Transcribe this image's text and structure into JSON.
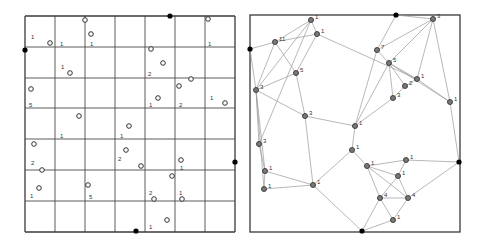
{
  "figure": {
    "panels": [
      {
        "id": "grid-panel",
        "frame": {
          "x": 25,
          "y": 16,
          "w": 210,
          "h": 216
        },
        "grid_x": [
          25,
          55,
          85,
          115,
          145,
          175,
          205,
          235
        ],
        "grid_y": [
          16,
          47,
          78,
          108,
          139,
          170,
          201,
          232
        ],
        "black_nodes": [
          {
            "x": 25,
            "y": 50
          },
          {
            "x": 170,
            "y": 16
          },
          {
            "x": 235,
            "y": 162
          },
          {
            "x": 136,
            "y": 231
          }
        ],
        "open_points": [
          {
            "x": 85,
            "y": 20
          },
          {
            "x": 91,
            "y": 34
          },
          {
            "x": 50,
            "y": 43
          },
          {
            "x": 208,
            "y": 19
          },
          {
            "x": 151,
            "y": 49
          },
          {
            "x": 163,
            "y": 63
          },
          {
            "x": 70,
            "y": 73
          },
          {
            "x": 31,
            "y": 89
          },
          {
            "x": 191,
            "y": 79
          },
          {
            "x": 179,
            "y": 86
          },
          {
            "x": 158,
            "y": 98
          },
          {
            "x": 225,
            "y": 103
          },
          {
            "x": 79,
            "y": 116
          },
          {
            "x": 129,
            "y": 126
          },
          {
            "x": 34,
            "y": 144
          },
          {
            "x": 126,
            "y": 150
          },
          {
            "x": 141,
            "y": 166
          },
          {
            "x": 181,
            "y": 160
          },
          {
            "x": 42,
            "y": 170
          },
          {
            "x": 172,
            "y": 176
          },
          {
            "x": 39,
            "y": 188
          },
          {
            "x": 88,
            "y": 185
          },
          {
            "x": 154,
            "y": 199
          },
          {
            "x": 182,
            "y": 199
          },
          {
            "x": 167,
            "y": 220
          }
        ],
        "labels": [
          {
            "x": 31,
            "y": 39,
            "t": "1"
          },
          {
            "x": 60,
            "y": 46,
            "t": "1"
          },
          {
            "x": 90,
            "y": 46,
            "t": "1"
          },
          {
            "x": 208,
            "y": 46,
            "t": "1"
          },
          {
            "x": 61,
            "y": 69,
            "t": "1"
          },
          {
            "x": 148,
            "y": 76,
            "t": "2"
          },
          {
            "x": 29,
            "y": 107,
            "t": "5"
          },
          {
            "x": 149,
            "y": 107,
            "t": "1"
          },
          {
            "x": 179,
            "y": 107,
            "t": "2"
          },
          {
            "x": 210,
            "y": 100,
            "t": "1"
          },
          {
            "x": 60,
            "y": 138,
            "t": "1"
          },
          {
            "x": 120,
            "y": 138,
            "t": "1"
          },
          {
            "x": 31,
            "y": 165,
            "t": "2"
          },
          {
            "x": 118,
            "y": 161,
            "t": "2"
          },
          {
            "x": 180,
            "y": 170,
            "t": "1"
          },
          {
            "x": 30,
            "y": 198,
            "t": "1"
          },
          {
            "x": 89,
            "y": 199,
            "t": "5"
          },
          {
            "x": 149,
            "y": 195,
            "t": "2"
          },
          {
            "x": 179,
            "y": 195,
            "t": "1"
          },
          {
            "x": 149,
            "y": 229,
            "t": "1"
          }
        ]
      },
      {
        "id": "network-panel",
        "frame": {
          "x": 250,
          "y": 15,
          "w": 210,
          "h": 217
        },
        "black_nodes": [
          {
            "id": "L",
            "x": 250,
            "y": 49
          },
          {
            "id": "T",
            "x": 396,
            "y": 15
          },
          {
            "id": "R",
            "x": 459,
            "y": 162
          },
          {
            "id": "B",
            "x": 362,
            "y": 231
          }
        ],
        "nodes": [
          {
            "id": "a",
            "x": 311,
            "y": 20,
            "t": "1"
          },
          {
            "id": "b",
            "x": 317,
            "y": 34,
            "t": "1"
          },
          {
            "id": "c",
            "x": 275,
            "y": 42,
            "t": "11"
          },
          {
            "id": "d",
            "x": 296,
            "y": 73,
            "t": "5"
          },
          {
            "id": "e",
            "x": 256,
            "y": 90,
            "t": "3"
          },
          {
            "id": "f",
            "x": 305,
            "y": 116,
            "t": "3"
          },
          {
            "id": "g",
            "x": 259,
            "y": 144,
            "t": "3"
          },
          {
            "id": "h",
            "x": 265,
            "y": 171,
            "t": "1"
          },
          {
            "id": "i",
            "x": 264,
            "y": 189,
            "t": "1"
          },
          {
            "id": "j",
            "x": 313,
            "y": 185,
            "t": "1"
          },
          {
            "id": "k",
            "x": 433,
            "y": 19,
            "t": "3"
          },
          {
            "id": "l",
            "x": 377,
            "y": 50,
            "t": "7"
          },
          {
            "id": "m",
            "x": 389,
            "y": 63,
            "t": "5"
          },
          {
            "id": "n",
            "x": 417,
            "y": 79,
            "t": "1"
          },
          {
            "id": "o",
            "x": 405,
            "y": 86,
            "t": "2"
          },
          {
            "id": "p",
            "x": 393,
            "y": 98,
            "t": "3"
          },
          {
            "id": "q",
            "x": 450,
            "y": 102,
            "t": "1"
          },
          {
            "id": "r",
            "x": 355,
            "y": 126,
            "t": "1"
          },
          {
            "id": "s",
            "x": 352,
            "y": 150,
            "t": "1"
          },
          {
            "id": "t",
            "x": 367,
            "y": 166,
            "t": "1"
          },
          {
            "id": "u",
            "x": 406,
            "y": 160,
            "t": "1"
          },
          {
            "id": "v",
            "x": 398,
            "y": 176,
            "t": "1"
          },
          {
            "id": "w",
            "x": 380,
            "y": 198,
            "t": "4"
          },
          {
            "id": "x",
            "x": 408,
            "y": 198,
            "t": "4"
          },
          {
            "id": "y",
            "x": 393,
            "y": 220,
            "t": "1"
          }
        ],
        "edges": [
          [
            "L",
            "c"
          ],
          [
            "L",
            "e"
          ],
          [
            "c",
            "a"
          ],
          [
            "c",
            "b"
          ],
          [
            "c",
            "e"
          ],
          [
            "c",
            "d"
          ],
          [
            "a",
            "b"
          ],
          [
            "a",
            "e"
          ],
          [
            "a",
            "g"
          ],
          [
            "b",
            "d"
          ],
          [
            "b",
            "n"
          ],
          [
            "d",
            "e"
          ],
          [
            "d",
            "f"
          ],
          [
            "e",
            "g"
          ],
          [
            "e",
            "h"
          ],
          [
            "e",
            "f"
          ],
          [
            "e",
            "i"
          ],
          [
            "g",
            "h"
          ],
          [
            "h",
            "i"
          ],
          [
            "h",
            "j"
          ],
          [
            "i",
            "j"
          ],
          [
            "f",
            "r"
          ],
          [
            "j",
            "B"
          ],
          [
            "j",
            "s"
          ],
          [
            "f",
            "j"
          ],
          [
            "T",
            "l"
          ],
          [
            "T",
            "k"
          ],
          [
            "l",
            "k"
          ],
          [
            "l",
            "m"
          ],
          [
            "l",
            "r"
          ],
          [
            "k",
            "m"
          ],
          [
            "k",
            "n"
          ],
          [
            "k",
            "q"
          ],
          [
            "m",
            "n"
          ],
          [
            "m",
            "o"
          ],
          [
            "m",
            "p"
          ],
          [
            "m",
            "q"
          ],
          [
            "n",
            "o"
          ],
          [
            "o",
            "p"
          ],
          [
            "p",
            "r"
          ],
          [
            "m",
            "r"
          ],
          [
            "r",
            "s"
          ],
          [
            "s",
            "t"
          ],
          [
            "t",
            "u"
          ],
          [
            "t",
            "v"
          ],
          [
            "t",
            "w"
          ],
          [
            "t",
            "x"
          ],
          [
            "u",
            "v"
          ],
          [
            "u",
            "R"
          ],
          [
            "v",
            "w"
          ],
          [
            "v",
            "x"
          ],
          [
            "w",
            "x"
          ],
          [
            "w",
            "y"
          ],
          [
            "w",
            "B"
          ],
          [
            "x",
            "y"
          ],
          [
            "x",
            "R"
          ],
          [
            "y",
            "B"
          ],
          [
            "q",
            "R"
          ],
          [
            "n",
            "q"
          ]
        ]
      }
    ],
    "colors": {
      "frame": "#3a3a3a",
      "grid": "#4a4a4a",
      "edge": "#9a9a9a",
      "node_fill": "#7a7a7a",
      "node_stroke": "#333333",
      "black_node": "#000000",
      "label": "#333333"
    }
  }
}
